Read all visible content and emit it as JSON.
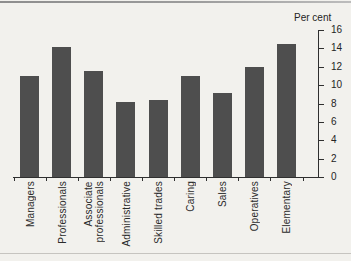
{
  "figure": {
    "axis_unit_label": "Per cent"
  },
  "chart_data": {
    "type": "bar",
    "title": "",
    "xlabel": "",
    "ylabel": "Per cent",
    "categories": [
      "Managers",
      "Professionals",
      "Associate\nprofessionals",
      "Administrative",
      "Skilled trades",
      "Caring",
      "Sales",
      "Operatives",
      "Elementary"
    ],
    "values": [
      11,
      14.1,
      11.5,
      8.2,
      8.4,
      11,
      9.1,
      12,
      14.5
    ],
    "ylim": [
      0,
      16
    ],
    "yticks": [
      0,
      2,
      4,
      6,
      8,
      10,
      12,
      14,
      16
    ],
    "axis_side": "right",
    "grid": false,
    "legend": "none",
    "bar_color": "#4e4e4e",
    "axis_color": "#2f2f2f"
  }
}
